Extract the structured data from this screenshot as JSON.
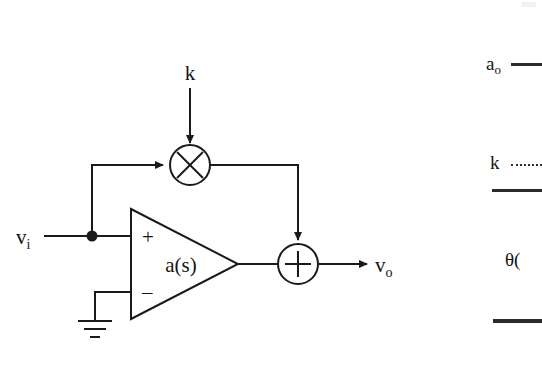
{
  "figure": {
    "type": "block-diagram",
    "background_color": "#ffffff",
    "line_color": "#1a1a1a"
  },
  "diagram": {
    "input_label": "v",
    "input_label_sub": "i",
    "output_label": "v",
    "output_label_sub": "o",
    "gain_label": "k",
    "amplifier_label": "a(s)",
    "opamp_plus": "+",
    "opamp_minus": "–",
    "multiplier_glyph": "×",
    "summer_glyph": "+",
    "ground_name": "ground-symbol"
  },
  "formula": {
    "numerator_term": "a",
    "numerator_term_sub": "o",
    "gain_term": "k",
    "theta_term": "θ(",
    "bar_solid": "",
    "bar_dotted": ""
  }
}
